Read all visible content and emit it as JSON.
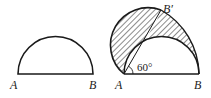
{
  "figure_left": {
    "label_a": "A",
    "label_b": "B"
  },
  "figure_right": {
    "label_a": "A",
    "label_b": "B",
    "label_b_prime": "B′",
    "angle_label": "60°"
  },
  "colors": {
    "stroke": "#1a1a1a",
    "background": "#ffffff"
  }
}
